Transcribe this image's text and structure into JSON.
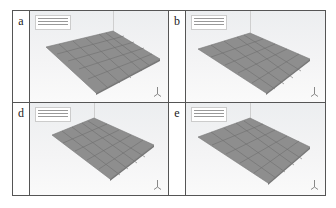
{
  "panels": [
    {
      "label": "a",
      "info_lines": 3
    },
    {
      "label": "b",
      "info_lines": 3
    },
    {
      "label": "d",
      "info_lines": 3
    },
    {
      "label": "e",
      "info_lines": 3
    }
  ],
  "colors": {
    "plate": "#8e8e8e",
    "mesh": "#6f6f6f",
    "border": "#555555"
  }
}
